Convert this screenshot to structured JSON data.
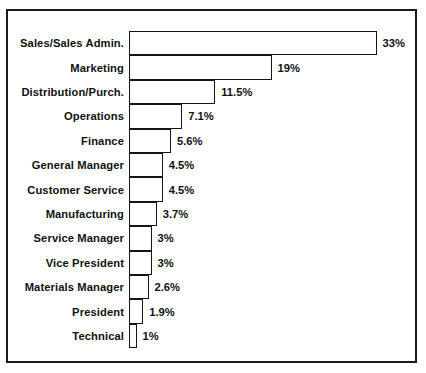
{
  "chart_data": {
    "type": "bar",
    "orientation": "horizontal",
    "title": "",
    "subtitle": "",
    "xlabel": "",
    "ylabel": "",
    "grid": false,
    "legend": false,
    "xlim": [
      0,
      33
    ],
    "value_suffix": "%",
    "categories": [
      "Sales/Sales Admin.",
      "Marketing",
      "Distribution/Purch.",
      "Operations",
      "Finance",
      "General Manager",
      "Customer Service",
      "Manufacturing",
      "Service Manager",
      "Vice President",
      "Materials Manager",
      "President",
      "Technical"
    ],
    "values": [
      33,
      19,
      11.5,
      7.1,
      5.6,
      4.5,
      4.5,
      3.7,
      3,
      3,
      2.6,
      1.9,
      1
    ],
    "value_labels": [
      "33%",
      "19%",
      "11.5%",
      "7.1%",
      "5.6%",
      "4.5%",
      "4.5%",
      "3.7%",
      "3%",
      "3%",
      "2.6%",
      "1.9%",
      "1%"
    ]
  },
  "style": {
    "bar_fill": "#ffffff",
    "bar_stroke": "#141414",
    "frame_stroke": "#1a1a1a",
    "text_color": "#111111",
    "background": "#ffffff"
  }
}
